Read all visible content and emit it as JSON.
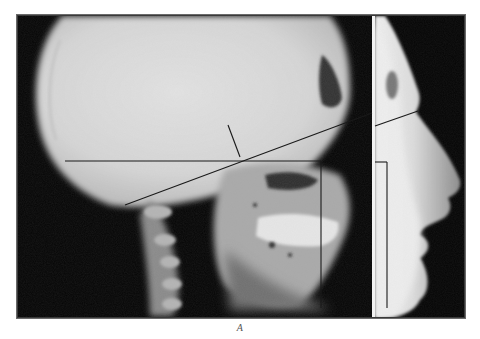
{
  "figure": {
    "caption": "A",
    "colors": {
      "background": "#ffffff",
      "film_dark": "#050505",
      "bone_light": "#d8d8d8",
      "tracing_line": "#1a1a1a",
      "divider": "#f2f2f2"
    },
    "frame": {
      "x": 17,
      "y": 15,
      "width": 448,
      "height": 303
    },
    "panels": [
      {
        "name": "skull-radiograph",
        "x": 17,
        "y": 15,
        "width": 355,
        "height": 303
      },
      {
        "name": "soft-tissue-profile",
        "x": 375,
        "y": 15,
        "width": 90,
        "height": 303
      }
    ],
    "divider_x": 373,
    "tracing_lines": [
      {
        "name": "sella-nasion-line",
        "x1": 125,
        "y1": 205,
        "x2": 372,
        "y2": 113
      },
      {
        "name": "profile-extension-line",
        "x1": 375,
        "y1": 126,
        "x2": 418,
        "y2": 111
      },
      {
        "name": "perpendicular-tick",
        "x1": 228,
        "y1": 125,
        "x2": 240,
        "y2": 157
      },
      {
        "name": "frankfort-horizontal",
        "x1": 65,
        "y1": 161,
        "x2": 321,
        "y2": 161
      },
      {
        "name": "facial-vertical",
        "x1": 321,
        "y1": 161,
        "x2": 321,
        "y2": 308
      },
      {
        "name": "profile-horizontal",
        "x1": 375,
        "y1": 162,
        "x2": 387,
        "y2": 162
      },
      {
        "name": "profile-vertical",
        "x1": 387,
        "y1": 162,
        "x2": 387,
        "y2": 308
      }
    ]
  }
}
